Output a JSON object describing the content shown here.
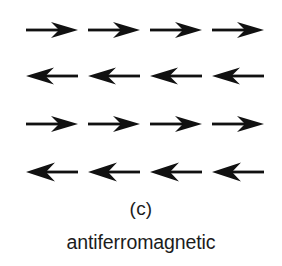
{
  "figure": {
    "panel_letter": "(c)",
    "caption": "antiferromagnetic",
    "background_color": "#ffffff",
    "arrow_color": "#111111",
    "text_color": "#1c1c1c"
  },
  "lattice": {
    "rows": 4,
    "columns": 4,
    "row_directions": [
      "right",
      "left",
      "right",
      "left"
    ],
    "arrows": [
      [
        {
          "direction": "right",
          "icon": "arrow-right-icon"
        },
        {
          "direction": "right",
          "icon": "arrow-right-icon"
        },
        {
          "direction": "right",
          "icon": "arrow-right-icon"
        },
        {
          "direction": "right",
          "icon": "arrow-right-icon"
        }
      ],
      [
        {
          "direction": "left",
          "icon": "arrow-left-icon"
        },
        {
          "direction": "left",
          "icon": "arrow-left-icon"
        },
        {
          "direction": "left",
          "icon": "arrow-left-icon"
        },
        {
          "direction": "left",
          "icon": "arrow-left-icon"
        }
      ],
      [
        {
          "direction": "right",
          "icon": "arrow-right-icon"
        },
        {
          "direction": "right",
          "icon": "arrow-right-icon"
        },
        {
          "direction": "right",
          "icon": "arrow-right-icon"
        },
        {
          "direction": "right",
          "icon": "arrow-right-icon"
        }
      ],
      [
        {
          "direction": "left",
          "icon": "arrow-left-icon"
        },
        {
          "direction": "left",
          "icon": "arrow-left-icon"
        },
        {
          "direction": "left",
          "icon": "arrow-left-icon"
        },
        {
          "direction": "left",
          "icon": "arrow-left-icon"
        }
      ]
    ]
  }
}
